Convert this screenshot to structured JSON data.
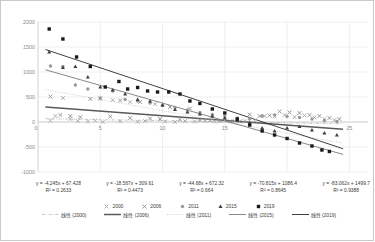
{
  "chart_data": {
    "type": "scatter",
    "title": "",
    "xlabel": "",
    "ylabel": "",
    "xlim": [
      0,
      26.5
    ],
    "ylim": [
      -1000,
      2000
    ],
    "xticks": [
      5,
      10,
      15,
      25
    ],
    "yticks": [
      2000,
      1500,
      1000,
      500,
      0,
      -500,
      -1000
    ],
    "grid": true,
    "legend_position": "bottom",
    "series": [
      {
        "name": "2000",
        "marker": "x",
        "color": "#a6a6a6",
        "trendline_label": "线性 (2000)",
        "trendline_style": "dash-dot",
        "trendline_color": "#b0b0b0",
        "equation": "y = -4.245x + 67.428",
        "r2": "R² = 0.2633",
        "slope": -4.245,
        "intercept": 67.428,
        "points": [
          [
            1,
            30
          ],
          [
            1.4,
            120
          ],
          [
            2,
            480
          ],
          [
            2.6,
            60
          ],
          [
            3.2,
            20
          ],
          [
            4,
            10
          ],
          [
            4.6,
            30
          ],
          [
            5.2,
            0
          ],
          [
            6,
            440
          ],
          [
            6.6,
            15
          ],
          [
            7.4,
            400
          ],
          [
            8,
            5
          ],
          [
            8.6,
            20
          ],
          [
            9.4,
            360
          ],
          [
            10.2,
            10
          ],
          [
            11,
            0
          ],
          [
            11.8,
            20
          ],
          [
            12.6,
            10
          ],
          [
            13.4,
            20
          ],
          [
            14.2,
            10
          ],
          [
            15,
            30
          ],
          [
            15.8,
            20
          ],
          [
            16.6,
            20
          ],
          [
            17.4,
            30
          ],
          [
            18.2,
            120
          ],
          [
            19,
            110
          ],
          [
            19.8,
            140
          ],
          [
            20.6,
            100
          ],
          [
            21.4,
            130
          ],
          [
            22.2,
            90
          ],
          [
            23,
            60
          ],
          [
            23.8,
            40
          ]
        ]
      },
      {
        "name": "2006",
        "marker": "x",
        "color": "#8c8c8c",
        "trendline_label": "线性 (2006)",
        "trendline_style": "solid-thick",
        "trendline_color": "#595959",
        "equation": "y = -18.567x + 309.61",
        "r2": "R² = 0.4473",
        "slope": -18.567,
        "intercept": 309.61,
        "points": [
          [
            1,
            510
          ],
          [
            1.8,
            140
          ],
          [
            2.6,
            120
          ],
          [
            3.4,
            100
          ],
          [
            4.2,
            460
          ],
          [
            5,
            470
          ],
          [
            5.8,
            110
          ],
          [
            6.6,
            430
          ],
          [
            7.4,
            80
          ],
          [
            8.2,
            400
          ],
          [
            9,
            70
          ],
          [
            9.8,
            60
          ],
          [
            10.6,
            300
          ],
          [
            11.4,
            50
          ],
          [
            12.2,
            270
          ],
          [
            13,
            40
          ],
          [
            13.8,
            30
          ],
          [
            14.6,
            20
          ],
          [
            15.4,
            10
          ],
          [
            16.2,
            10
          ],
          [
            17,
            150
          ],
          [
            17.8,
            120
          ],
          [
            18.6,
            130
          ],
          [
            19.4,
            210
          ],
          [
            20.2,
            190
          ],
          [
            21,
            180
          ],
          [
            21.8,
            140
          ],
          [
            22.6,
            120
          ],
          [
            23.4,
            80
          ],
          [
            24.2,
            60
          ]
        ]
      },
      {
        "name": "2011",
        "marker": "circle",
        "color": "#999999",
        "trendline_label": "线性 (2011)",
        "trendline_style": "dotted",
        "trendline_color": "#c0c0c0",
        "equation": "y = -44.68x + 672.32",
        "r2": "R² = 0.664",
        "slope": -44.68,
        "intercept": 672.32,
        "points": [
          [
            1,
            1120
          ],
          [
            2,
            1110
          ],
          [
            3,
            740
          ],
          [
            4,
            660
          ],
          [
            5,
            480
          ],
          [
            6,
            620
          ],
          [
            7,
            450
          ],
          [
            8,
            420
          ],
          [
            9,
            380
          ],
          [
            10,
            330
          ],
          [
            11,
            290
          ],
          [
            12,
            240
          ],
          [
            13,
            190
          ],
          [
            14,
            150
          ],
          [
            15,
            110
          ],
          [
            16,
            80
          ],
          [
            17,
            60
          ],
          [
            18,
            120
          ],
          [
            19,
            140
          ],
          [
            20,
            110
          ],
          [
            21,
            90
          ],
          [
            22,
            60
          ],
          [
            23,
            30
          ],
          [
            24,
            10
          ]
        ]
      },
      {
        "name": "2015",
        "marker": "triangle",
        "color": "#3f3f3f",
        "trendline_label": "线性 (2015)",
        "trendline_style": "solid",
        "trendline_color": "#7a7a7a",
        "equation": "y = -70.815x + 1086.4",
        "r2": "R² = 0.8645",
        "slope": -70.815,
        "intercept": 1086.4,
        "points": [
          [
            0.9,
            1400
          ],
          [
            2,
            1090
          ],
          [
            3,
            1110
          ],
          [
            4,
            900
          ],
          [
            5,
            700
          ],
          [
            6,
            640
          ],
          [
            7,
            560
          ],
          [
            8,
            450
          ],
          [
            9,
            420
          ],
          [
            10,
            340
          ],
          [
            11,
            250
          ],
          [
            12,
            200
          ],
          [
            13,
            160
          ],
          [
            14,
            120
          ],
          [
            15,
            80
          ],
          [
            16,
            40
          ],
          [
            17,
            -20
          ],
          [
            18,
            -120
          ],
          [
            19,
            -180
          ],
          [
            20,
            -120
          ],
          [
            21,
            -90
          ],
          [
            22,
            -160
          ],
          [
            23,
            -220
          ],
          [
            24,
            -260
          ]
        ]
      },
      {
        "name": "2019",
        "marker": "square",
        "color": "#1a1a1a",
        "trendline_label": "线性 (2019)",
        "trendline_style": "solid",
        "trendline_color": "#2b2b2b",
        "equation": "y = -83.062x + 1499.7",
        "r2": "R² = 0.9388",
        "slope": -83.062,
        "intercept": 1499.7,
        "points": [
          [
            0.9,
            1860
          ],
          [
            2,
            1660
          ],
          [
            3.1,
            1300
          ],
          [
            4.2,
            1110
          ],
          [
            5.4,
            700
          ],
          [
            6.5,
            810
          ],
          [
            7.2,
            660
          ],
          [
            8,
            690
          ],
          [
            8.8,
            620
          ],
          [
            9.6,
            600
          ],
          [
            10.5,
            600
          ],
          [
            11.4,
            560
          ],
          [
            12.2,
            420
          ],
          [
            13,
            370
          ],
          [
            14,
            260
          ],
          [
            15,
            180
          ],
          [
            16,
            60
          ],
          [
            17,
            -60
          ],
          [
            18,
            -180
          ],
          [
            19,
            -260
          ],
          [
            20,
            -330
          ],
          [
            21,
            -420
          ],
          [
            22,
            -480
          ],
          [
            22.8,
            -560
          ],
          [
            23.4,
            -590
          ]
        ]
      }
    ]
  },
  "axes": {
    "y_labels": [
      "2000",
      "1500",
      "1000",
      "500",
      "0",
      "-500",
      "-1000"
    ],
    "x_labels": [
      "5",
      "10",
      "15",
      "25"
    ],
    "origin_label": "0"
  },
  "equations": [
    {
      "line": "y = -4.245x + 67.428",
      "r2": "R² = 0.2633"
    },
    {
      "line": "y = -18.567x + 309.61",
      "r2": "R² = 0.4473"
    },
    {
      "line": "y = -44.68x + 672.32",
      "r2": "R² = 0.664"
    },
    {
      "line": "y = -70.815x + 1086.4",
      "r2": "R² = 0.8645"
    },
    {
      "line": "y = -83.062x + 1499.7",
      "r2": "R² = 0.9388"
    }
  ],
  "legend": {
    "markers": [
      {
        "label": "2000",
        "marker": "x-marker-icon"
      },
      {
        "label": "2006",
        "marker": "x-marker-icon"
      },
      {
        "label": "2011",
        "marker": "circle-marker-icon"
      },
      {
        "label": "2015",
        "marker": "triangle-marker-icon"
      },
      {
        "label": "2019",
        "marker": "square-marker-icon"
      }
    ],
    "trendlines": [
      {
        "label": "线性 (2000)",
        "style": "dash-dot"
      },
      {
        "label": "线性 (2006)",
        "style": "solid-thick"
      },
      {
        "label": "线性 (2011)",
        "style": "dotted"
      },
      {
        "label": "线性 (2015)",
        "style": "solid"
      },
      {
        "label": "线性 (2019)",
        "style": "solid"
      }
    ]
  },
  "colors": {
    "grid": "#e4e4e4",
    "axis": "#bdbdbd",
    "text": "#8a8a8a",
    "eq_text": "#3a3a3a",
    "border": "#c9c9c9"
  }
}
